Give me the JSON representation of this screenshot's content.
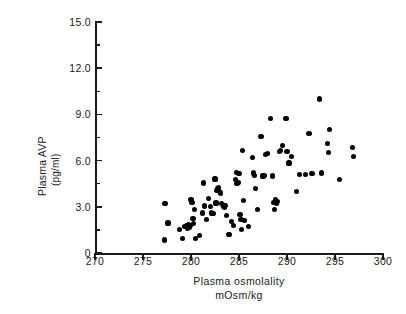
{
  "chart_data": {
    "type": "scatter",
    "title": "",
    "xlabel": "Plasma osmolality",
    "xlabel_units": "mOsm/kg",
    "ylabel": "Plasma AVP",
    "ylabel_units": "(pg/ml)",
    "xlim": [
      270,
      300
    ],
    "ylim": [
      0,
      15
    ],
    "xticks": [
      270,
      275,
      280,
      285,
      290,
      295,
      300
    ],
    "xtick_labels": [
      "270",
      "275",
      "280",
      "285",
      "290",
      "295",
      "300"
    ],
    "yticks": [
      0,
      3.0,
      6.0,
      9.0,
      12.0,
      15.0
    ],
    "ytick_labels": [
      "0",
      "3.0",
      "6.0",
      "9.0",
      "12.0",
      "15.0"
    ],
    "yticks_minor": [
      1.5,
      4.5,
      7.5,
      10.5,
      13.5
    ],
    "grid": false,
    "legend": null,
    "marker_color": "#000000",
    "axis_color": "#1a1a1a",
    "points": [
      [
        277.3,
        3.2
      ],
      [
        277.6,
        1.95
      ],
      [
        277.2,
        0.85
      ],
      [
        278.8,
        1.55
      ],
      [
        279.1,
        0.95
      ],
      [
        279.3,
        1.7
      ],
      [
        279.5,
        1.75
      ],
      [
        279.6,
        1.6
      ],
      [
        279.7,
        1.85
      ],
      [
        279.8,
        1.65
      ],
      [
        279.9,
        1.8
      ],
      [
        280.0,
        3.45
      ],
      [
        280.1,
        3.3
      ],
      [
        280.2,
        2.25
      ],
      [
        280.3,
        1.9
      ],
      [
        280.4,
        2.85
      ],
      [
        280.5,
        0.95
      ],
      [
        280.9,
        1.15
      ],
      [
        281.2,
        2.6
      ],
      [
        281.3,
        4.55
      ],
      [
        281.4,
        3.05
      ],
      [
        281.6,
        2.2
      ],
      [
        281.8,
        3.55
      ],
      [
        282.0,
        3.0
      ],
      [
        282.1,
        2.6
      ],
      [
        282.3,
        2.55
      ],
      [
        282.5,
        4.8
      ],
      [
        282.6,
        3.25
      ],
      [
        282.7,
        4.05
      ],
      [
        282.8,
        4.15
      ],
      [
        282.9,
        4.25
      ],
      [
        283.0,
        4.0
      ],
      [
        283.1,
        3.9
      ],
      [
        283.2,
        3.2
      ],
      [
        283.3,
        3.15
      ],
      [
        283.35,
        3.1
      ],
      [
        283.4,
        3.05
      ],
      [
        283.5,
        2.95
      ],
      [
        283.6,
        3.1
      ],
      [
        283.7,
        2.45
      ],
      [
        283.9,
        1.2
      ],
      [
        284.0,
        1.2
      ],
      [
        284.2,
        2.05
      ],
      [
        284.4,
        1.8
      ],
      [
        284.6,
        4.75
      ],
      [
        284.7,
        5.25
      ],
      [
        284.8,
        4.5
      ],
      [
        284.9,
        4.6
      ],
      [
        285.0,
        5.15
      ],
      [
        285.1,
        2.5
      ],
      [
        285.2,
        2.2
      ],
      [
        285.3,
        1.55
      ],
      [
        285.4,
        6.65
      ],
      [
        285.5,
        3.4
      ],
      [
        285.6,
        2.1
      ],
      [
        286.0,
        1.7
      ],
      [
        286.4,
        6.2
      ],
      [
        286.5,
        5.2
      ],
      [
        286.6,
        5.05
      ],
      [
        286.7,
        4.2
      ],
      [
        286.9,
        2.8
      ],
      [
        287.3,
        7.55
      ],
      [
        287.5,
        5.0
      ],
      [
        287.6,
        5.05
      ],
      [
        287.8,
        6.4
      ],
      [
        288.0,
        6.45
      ],
      [
        288.3,
        8.75
      ],
      [
        288.5,
        5.0
      ],
      [
        288.6,
        3.3
      ],
      [
        288.7,
        2.85
      ],
      [
        288.8,
        3.5
      ],
      [
        288.9,
        3.2
      ],
      [
        289.0,
        3.35
      ],
      [
        289.2,
        6.6
      ],
      [
        289.3,
        6.65
      ],
      [
        289.5,
        7.0
      ],
      [
        289.9,
        8.75
      ],
      [
        290.0,
        6.6
      ],
      [
        290.2,
        5.85
      ],
      [
        290.5,
        6.25
      ],
      [
        291.0,
        4.0
      ],
      [
        291.3,
        5.1
      ],
      [
        291.9,
        5.1
      ],
      [
        292.3,
        7.75
      ],
      [
        292.6,
        5.15
      ],
      [
        293.4,
        10.0
      ],
      [
        293.6,
        5.2
      ],
      [
        294.2,
        7.1
      ],
      [
        294.3,
        6.55
      ],
      [
        294.4,
        8.0
      ],
      [
        295.5,
        4.75
      ],
      [
        296.8,
        6.85
      ],
      [
        296.9,
        6.25
      ]
    ]
  }
}
